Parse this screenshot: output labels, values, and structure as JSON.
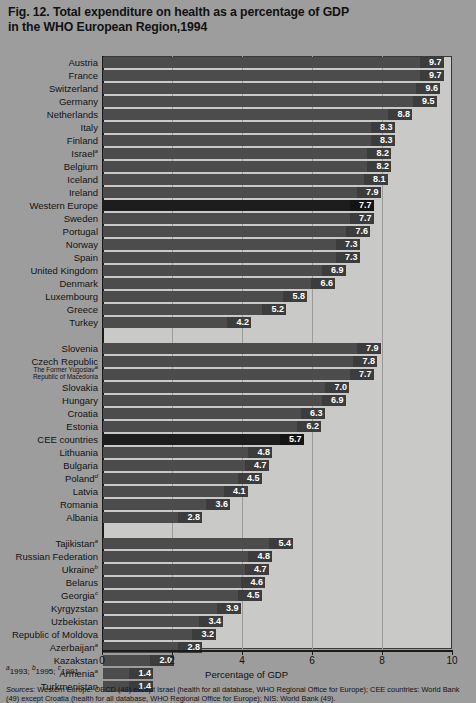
{
  "title": {
    "line1": "Fig. 12. Total expenditure on health as a percentage of GDP",
    "line2": "in the WHO European Region,1994"
  },
  "footnote": {
    "a_marker": "a",
    "a_text": "1993; ",
    "b_marker": "b",
    "b_text": "1995; ",
    "c_marker": "c",
    "c_text": "1991."
  },
  "sources": {
    "label": "Sources:",
    "line1": " Western Europe: OECD (48) except Israel (health for all database, WHO Regional Office for Europe); CEE",
    "line2": "countries: World Bank (49) except Croatia (health for all database, WHO Regional Office for Europe); NIS: World Bank (49)."
  },
  "chart_data": {
    "type": "bar",
    "orientation": "horizontal",
    "title": "Fig. 12. Total expenditure on health as a percentage of GDP in the WHO European Region,1994",
    "xlabel": "Percentage of GDP",
    "ylabel": "",
    "xlim": [
      0,
      10
    ],
    "xticks": [
      0,
      2,
      4,
      6,
      8,
      10
    ],
    "grid": true,
    "legend": "none",
    "groups": [
      {
        "name": "Western Europe",
        "categories": [
          "Austria",
          "France",
          "Switzerland",
          "Germany",
          "Netherlands",
          "Italy",
          "Finland",
          "Israel",
          "Belgium",
          "Iceland",
          "Ireland",
          "Western Europe",
          "Sweden",
          "Portugal",
          "Norway",
          "Spain",
          "United Kingdom",
          "Denmark",
          "Luxembourg",
          "Greece",
          "Turkey"
        ],
        "values": [
          9.7,
          9.7,
          9.6,
          9.5,
          8.8,
          8.3,
          8.3,
          8.2,
          8.2,
          8.1,
          7.9,
          7.7,
          7.7,
          7.6,
          7.3,
          7.3,
          6.9,
          6.6,
          5.8,
          5.2,
          4.2
        ],
        "superscripts": [
          "",
          "",
          "",
          "",
          "",
          "",
          "",
          "a",
          "",
          "",
          "",
          "",
          "",
          "",
          "",
          "",
          "",
          "",
          "",
          "",
          ""
        ],
        "highlight": [
          "Western Europe"
        ]
      },
      {
        "name": "CEE countries",
        "categories": [
          "Slovenia",
          "Czech Republic",
          "The Former Yugoslav Republic of Macedonia",
          "Slovakia",
          "Hungary",
          "Croatia",
          "Estonia",
          "CEE countries",
          "Lithuania",
          "Bulgaria",
          "Poland",
          "Latvia",
          "Romania",
          "Albania"
        ],
        "values": [
          7.9,
          7.8,
          7.7,
          7.0,
          6.9,
          6.3,
          6.2,
          5.7,
          4.8,
          4.7,
          4.5,
          4.1,
          3.6,
          2.8
        ],
        "superscripts": [
          "",
          "",
          "a",
          "",
          "",
          "",
          "",
          "",
          "",
          "",
          "d",
          "",
          "",
          ""
        ],
        "highlight": [
          "CEE countries"
        ]
      },
      {
        "name": "NIS",
        "categories": [
          "Tajikistan",
          "Russian Federation",
          "Ukraine",
          "Belarus",
          "Georgia",
          "Kyrgyzstan",
          "Uzbekistan",
          "Republic of Moldova",
          "Azerbaijan",
          "Kazakstan",
          "Armenia",
          "Turkmenistan"
        ],
        "values": [
          5.4,
          4.8,
          4.7,
          4.6,
          4.5,
          3.9,
          3.4,
          3.2,
          2.8,
          2.0,
          1.4,
          1.4
        ],
        "superscripts": [
          "a",
          "",
          "b",
          "",
          "c",
          "",
          "",
          "",
          "a",
          "",
          "a",
          ""
        ],
        "highlight": []
      }
    ]
  },
  "colors": {
    "page_bg": "#9d9d9d",
    "plot_bg": "#c9c9c7",
    "bar": "#4c4c4c",
    "bar_highlight": "#1d1d1d",
    "value_label": "#ffffff",
    "axis": "#1b1b1b"
  }
}
